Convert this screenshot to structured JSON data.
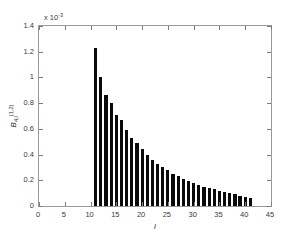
{
  "chart_data": {
    "type": "bar",
    "title": "",
    "subtitle": "",
    "xlabel": "l",
    "ylabel": "B_{4,l}^{(1,2)}",
    "ylabel_base": "B",
    "ylabel_sub": "4,l",
    "ylabel_sup": "(1,2)",
    "y_multiplier_label": "x 10",
    "y_multiplier_exponent": "-3",
    "y_multiplier_value": 0.001,
    "xlim": [
      0,
      45
    ],
    "ylim": [
      0,
      1.4
    ],
    "xticks": [
      0,
      5,
      10,
      15,
      20,
      25,
      30,
      35,
      40,
      45
    ],
    "xticklabels": [
      "0",
      "5",
      "10",
      "15",
      "20",
      "25",
      "30",
      "35",
      "40",
      "45"
    ],
    "yticks": [
      0,
      0.2,
      0.4,
      0.6,
      0.8,
      1,
      1.2,
      1.4
    ],
    "yticklabels": [
      "0",
      "0.2",
      "0.4",
      "0.6",
      "0.8",
      "1",
      "1.2",
      "1.4"
    ],
    "grid": false,
    "legend": null,
    "bar_color": "#0a0a0a",
    "axis_color": "#9a9a9a",
    "background": "#ffffff",
    "categories": [
      11,
      12,
      13,
      14,
      15,
      16,
      17,
      18,
      19,
      20,
      21,
      22,
      23,
      24,
      25,
      26,
      27,
      28,
      29,
      30,
      31,
      32,
      33,
      34,
      35,
      36,
      37,
      38,
      39,
      40,
      41
    ],
    "values": [
      1.23,
      1.0,
      0.86,
      0.8,
      0.71,
      0.67,
      0.59,
      0.53,
      0.49,
      0.44,
      0.4,
      0.36,
      0.33,
      0.3,
      0.28,
      0.25,
      0.23,
      0.21,
      0.195,
      0.18,
      0.165,
      0.15,
      0.14,
      0.13,
      0.12,
      0.11,
      0.1,
      0.09,
      0.08,
      0.07,
      0.06
    ],
    "value_units": "x 10^-3"
  }
}
